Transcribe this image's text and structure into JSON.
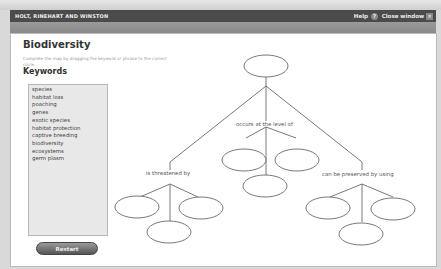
{
  "titlebar": {
    "brand": "HOLT, RINEHART AND WINSTON",
    "help_label": "Help",
    "help_icon": "?",
    "close_label": "Close window",
    "close_icon": "✕"
  },
  "main": {
    "title": "Biodiversity",
    "instructions": "Complete the map by dragging the keyword or phrase to the correct circle.",
    "keywords_heading": "Keywords",
    "keywords": [
      "species",
      "habitat loss",
      "poaching",
      "genes",
      "exotic species",
      "habitat protection",
      "captive breeding",
      "biodiversity",
      "ecosystems",
      "germ plasm"
    ],
    "restart_label": "Restart"
  },
  "diagram": {
    "links": {
      "center": "occurs at the level of",
      "left": "is threatened by",
      "right": "can be preserved by using"
    },
    "stroke_color": "#555555"
  }
}
